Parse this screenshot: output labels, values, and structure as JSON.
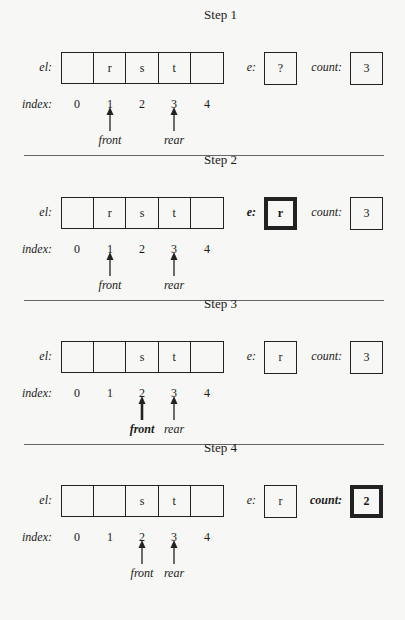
{
  "labels": {
    "el": "el:",
    "index": "index:",
    "e": "e:",
    "count": "count:"
  },
  "indices": [
    "0",
    "1",
    "2",
    "3",
    "4"
  ],
  "pointer_labels": {
    "front": "front",
    "rear": "rear"
  },
  "steps": [
    {
      "title": "Step 1",
      "cells": [
        "",
        "r",
        "s",
        "t",
        ""
      ],
      "e": "?",
      "count": "3",
      "front_index": 1,
      "rear_index": 3,
      "highlight": null
    },
    {
      "title": "Step 2",
      "cells": [
        "",
        "r",
        "s",
        "t",
        ""
      ],
      "e": "r",
      "count": "3",
      "front_index": 1,
      "rear_index": 3,
      "highlight": "e"
    },
    {
      "title": "Step 3",
      "cells": [
        "",
        "",
        "s",
        "t",
        ""
      ],
      "e": "r",
      "count": "3",
      "front_index": 2,
      "rear_index": 3,
      "highlight": "front"
    },
    {
      "title": "Step 4",
      "cells": [
        "",
        "",
        "s",
        "t",
        ""
      ],
      "e": "r",
      "count": "2",
      "front_index": 2,
      "rear_index": 3,
      "highlight": "count"
    }
  ]
}
